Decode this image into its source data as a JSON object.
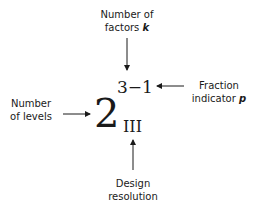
{
  "diagram": {
    "base": "2",
    "exponent": "3−1",
    "subscript": "III",
    "labels": {
      "factors_line1": "Number of",
      "factors_line2": "factors",
      "factors_var": "k",
      "fraction_line1": "Fraction",
      "fraction_line2": "indicator",
      "fraction_var": "p",
      "levels_line1": "Number",
      "levels_line2": "of levels",
      "resolution_line1": "Design",
      "resolution_line2": "resolution"
    }
  }
}
